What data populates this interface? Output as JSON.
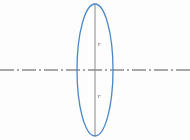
{
  "figure": {
    "name": "ellipse-radius-diagram",
    "width": 190,
    "height": 140,
    "background_color": "#fdfdfd"
  },
  "colors": {
    "ellipse_stroke": "#4a86c5",
    "vertical_line": "#8a8a8a",
    "axis_line": "#555555",
    "label_text": "#5a5a5a"
  },
  "ellipse": {
    "center_x": 95,
    "center_y": 70,
    "radius_x": 18,
    "radius_y": 66,
    "stroke_width": 1.3
  },
  "vertical_line": {
    "x": 95,
    "y_top": 4,
    "y_bottom": 136,
    "stroke_width": 1
  },
  "axis_line": {
    "y": 70,
    "x_start": 0,
    "x_end": 190,
    "stroke_width": 1.1,
    "dash_pattern": "14 3 2 3",
    "style": "dash-dot centerline"
  },
  "labels": {
    "upper_radius": {
      "text": "r",
      "x": 99,
      "y": 44
    },
    "lower_radius": {
      "text": "r",
      "x": 99,
      "y": 96
    }
  }
}
